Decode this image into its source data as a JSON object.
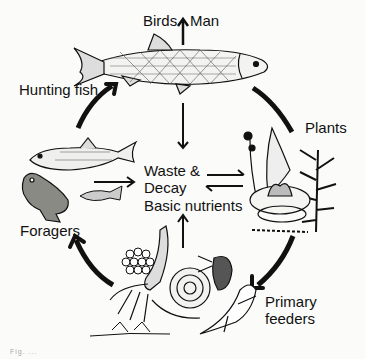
{
  "diagram": {
    "labels": {
      "top_consumers_left": "Birds",
      "top_consumers_right": "Man",
      "hunting_fish": "Hunting fish",
      "plants": "Plants",
      "center_line1": "Waste &",
      "center_line2": "Decay",
      "center_line3": "Basic nutrients",
      "foragers": "Foragers",
      "primary_line1": "Primary",
      "primary_line2": "feeders"
    },
    "illustrations": [
      "large-fish-icon",
      "small-fish-icon",
      "frog-icon",
      "stickleback-icon",
      "water-plants-icon",
      "water-lily-icon",
      "insect-larva-icon",
      "snail-icon",
      "water-flea-icon",
      "newt-icon",
      "egg-mass-icon"
    ],
    "flows": [
      {
        "from": "Hunting fish",
        "to": "Birds / Man"
      },
      {
        "from": "Plants",
        "to": "Primary feeders"
      },
      {
        "from": "Primary feeders",
        "to": "Foragers"
      },
      {
        "from": "Foragers",
        "to": "Hunting fish"
      },
      {
        "from": "Hunting fish",
        "to": "Waste & Decay"
      },
      {
        "from": "Foragers",
        "to": "Waste & Decay"
      },
      {
        "from": "Primary feeders",
        "to": "Waste & Decay"
      },
      {
        "from": "Waste & Decay",
        "to": "Plants",
        "bidirectional": true
      }
    ],
    "caption": "Fig. ..."
  }
}
